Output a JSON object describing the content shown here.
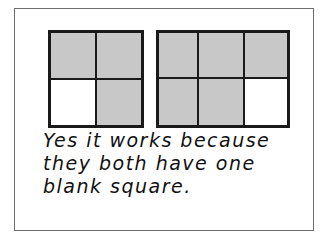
{
  "figure": {
    "left_grid": {
      "rows": 2,
      "cols": 2,
      "cells": [
        "shaded",
        "shaded",
        "blank",
        "shaded"
      ]
    },
    "right_grid": {
      "rows": 2,
      "cols": 3,
      "cells": [
        "shaded",
        "shaded",
        "shaded",
        "shaded",
        "shaded",
        "blank"
      ]
    },
    "colors": {
      "shaded": "#c8c8c8",
      "blank": "#ffffff",
      "lines": "#1a1a1a",
      "frame": "#6e6e6e"
    },
    "caption": {
      "line1": "Yes it works because",
      "line2": "they both have one",
      "line3": "blank square."
    }
  }
}
